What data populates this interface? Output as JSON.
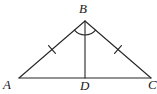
{
  "figure": {
    "name": "isosceles-triangle-with-median",
    "background_color": "#ffffff",
    "stroke_color": "#262626",
    "stroke_width": 1.1
  },
  "labels": {
    "a": "A",
    "b": "B",
    "c": "C",
    "d": "D"
  },
  "geometry": {
    "points": {
      "A": {
        "x": 19,
        "y": 78
      },
      "B": {
        "x": 85,
        "y": 21
      },
      "C": {
        "x": 151,
        "y": 78
      },
      "D": {
        "x": 85,
        "y": 78
      }
    },
    "segments": [
      {
        "name": "side-AB",
        "from": "A",
        "to": "B"
      },
      {
        "name": "side-BC",
        "from": "B",
        "to": "C"
      },
      {
        "name": "base-AC",
        "from": "A",
        "to": "C"
      },
      {
        "name": "median-BD",
        "from": "B",
        "to": "D"
      }
    ],
    "tick_marks": [
      {
        "name": "tick-AB",
        "on": "side-AB",
        "count": 1,
        "position": 0.5
      },
      {
        "name": "tick-BC",
        "on": "side-BC",
        "count": 1,
        "position": 0.5
      }
    ],
    "angle_arcs": [
      {
        "name": "angle-arc-B",
        "at": "B",
        "radius": 14
      }
    ]
  }
}
